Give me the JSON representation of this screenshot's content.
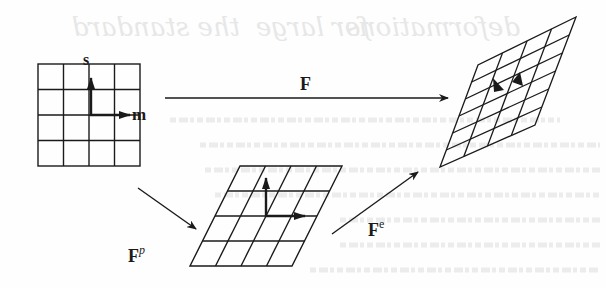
{
  "figure": {
    "labels": {
      "slip_direction": "s",
      "slip_normal": "m",
      "total": "F",
      "plastic": "F",
      "plastic_sup": "p",
      "elastic": "F",
      "elastic_sup": "e"
    },
    "configurations": [
      {
        "name": "reference",
        "rows": 4,
        "cols": 4
      },
      {
        "name": "intermediate",
        "rows": 4,
        "cols": 4
      },
      {
        "name": "current",
        "rows": 6,
        "cols": 4
      }
    ],
    "colors": {
      "ink": "#1a1a1a",
      "paper": "#fefefe",
      "bleed_through": "#e6e6e6"
    }
  },
  "bleed_through_text": [
    "deformations",
    "for large",
    "the standard"
  ]
}
